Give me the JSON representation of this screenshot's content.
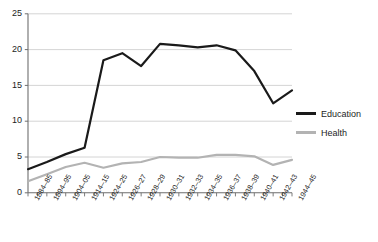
{
  "chart_data": {
    "type": "line",
    "title": "",
    "subtitle": "",
    "xlabel": "",
    "ylabel": "",
    "ylim": [
      0,
      25
    ],
    "yticks": [
      0,
      5,
      10,
      15,
      20,
      25
    ],
    "grid": true,
    "legend_position": "right",
    "categories": [
      "1884–85",
      "1894–95",
      "1904–05",
      "1914–15",
      "1924–25",
      "1926–27",
      "1928–29",
      "1930–31",
      "1932–33",
      "1934–35",
      "1936–37",
      "1938–39",
      "1940–41",
      "1942–43",
      "1944–45"
    ],
    "series": [
      {
        "name": "Education",
        "color": "#1a1a1a",
        "values": [
          3.3,
          4.3,
          5.4,
          6.3,
          18.5,
          19.5,
          17.7,
          20.8,
          20.6,
          20.3,
          20.6,
          19.9,
          17.0,
          12.5,
          14.3
        ]
      },
      {
        "name": "Health",
        "color": "#b3b3b3",
        "values": [
          1.6,
          2.6,
          3.6,
          4.2,
          3.5,
          4.1,
          4.3,
          5.0,
          4.9,
          4.9,
          5.3,
          5.3,
          5.1,
          3.9,
          4.6
        ]
      }
    ]
  },
  "axes": {
    "y_tick_labels": [
      "25",
      "20",
      "15",
      "10",
      "5",
      "0"
    ]
  },
  "legend": {
    "items": [
      {
        "label": "Education",
        "color": "#1a1a1a",
        "swatch": "line-swatch-education"
      },
      {
        "label": "Health",
        "color": "#b3b3b3",
        "swatch": "line-swatch-health"
      }
    ]
  }
}
